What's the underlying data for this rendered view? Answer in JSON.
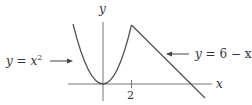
{
  "figure": {
    "axes": {
      "x_label": "x",
      "y_label": "y",
      "tick_label": "2"
    },
    "curves": [
      {
        "name": "parabola",
        "label_lhs": "y",
        "label_eq": "=",
        "label_rhs": "x",
        "label_sup": "2"
      },
      {
        "name": "line",
        "label_lhs": "y",
        "label_eq": "=",
        "label_rhs": "6 − x"
      }
    ],
    "colors": {
      "curve": "#555555",
      "axis": "#777777",
      "text": "#333333"
    }
  }
}
